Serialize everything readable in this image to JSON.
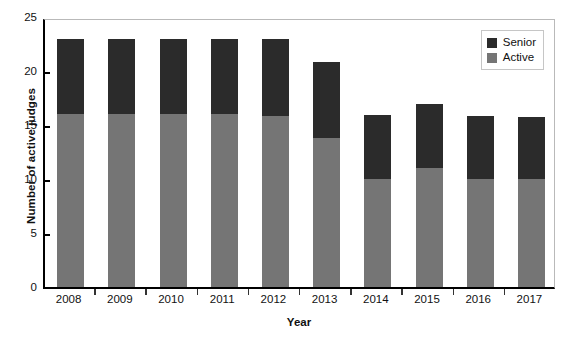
{
  "chart_data": {
    "type": "bar",
    "stacked": true,
    "title": "",
    "xlabel": "Year",
    "ylabel": "Number of active judges",
    "categories": [
      "2008",
      "2009",
      "2010",
      "2011",
      "2012",
      "2013",
      "2014",
      "2015",
      "2016",
      "2017"
    ],
    "series": [
      {
        "name": "Active",
        "color": "#757575",
        "values": [
          16,
          16,
          16,
          16,
          15.8,
          13.8,
          10,
          11,
          10,
          10
        ]
      },
      {
        "name": "Senior",
        "color": "#2b2b2b",
        "values": [
          7,
          7,
          7,
          7,
          7.2,
          7,
          5.9,
          5.9,
          5.8,
          5.7
        ]
      }
    ],
    "totals": [
      23,
      23,
      23,
      23,
      23,
      20.8,
      15.9,
      16.9,
      15.8,
      15.7
    ],
    "ylim": [
      0,
      25
    ],
    "yticks": [
      "0",
      "5",
      "10",
      "15",
      "20",
      "25"
    ],
    "ytick_values": [
      0,
      5,
      10,
      15,
      20,
      25
    ],
    "grid": false,
    "legend_position": "top-right"
  },
  "legend": {
    "entries": [
      {
        "label": "Senior",
        "color": "#2b2b2b"
      },
      {
        "label": "Active",
        "color": "#757575"
      }
    ]
  }
}
